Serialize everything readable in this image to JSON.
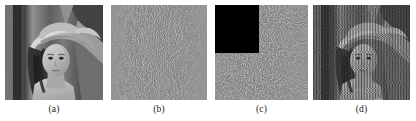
{
  "figure": {
    "background_color": "#ffffff",
    "width": 416,
    "height": 121,
    "panel_count": 4
  },
  "panels": [
    {
      "id": "panel-a",
      "caption": "(a)",
      "content_name": "original-lena-grayscale-image",
      "description": "Grayscale Lena portrait, original plain image",
      "x": 5,
      "y": 5,
      "width": 98,
      "height": 95,
      "caption_x": 5,
      "caption_y": 103,
      "caption_width": 98,
      "base_color": "#8a8a8a",
      "has_occluder": false,
      "striped": false
    },
    {
      "id": "panel-b",
      "caption": "(b)",
      "content_name": "cipher-noise-image",
      "description": "Uniform noise-like encrypted cipher image",
      "x": 111,
      "y": 5,
      "width": 96,
      "height": 95,
      "caption_x": 111,
      "caption_y": 103,
      "caption_width": 96,
      "base_color": "#6e6e6e",
      "has_occluder": false,
      "striped": false
    },
    {
      "id": "panel-c",
      "caption": "(c)",
      "content_name": "cropped-cipher-image",
      "description": "Cipher image with top-left square region cropped to black",
      "x": 215,
      "y": 5,
      "width": 93,
      "height": 95,
      "caption_x": 215,
      "caption_y": 103,
      "caption_width": 93,
      "base_color": "#6e6e6e",
      "has_occluder": true,
      "occluder": {
        "x": 0,
        "y": 0,
        "width": 44,
        "height": 48,
        "color": "#000000"
      },
      "striped": false
    },
    {
      "id": "panel-d",
      "caption": "(d)",
      "content_name": "decrypted-lena-with-artifacts",
      "description": "Decrypted Lena image degraded by vertical stripe artifacts from the cropped region",
      "x": 313,
      "y": 5,
      "width": 97,
      "height": 95,
      "caption_x": 313,
      "caption_y": 103,
      "caption_width": 97,
      "base_color": "#8a8a8a",
      "has_occluder": false,
      "striped": true
    }
  ]
}
